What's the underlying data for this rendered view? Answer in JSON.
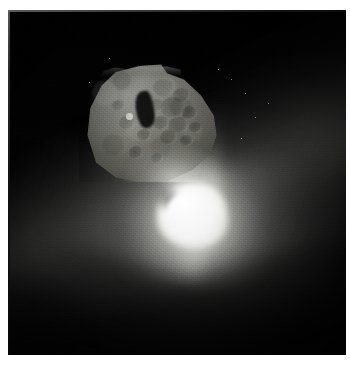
{
  "page": {
    "width": 350,
    "height": 366,
    "background_color": "#ffffff",
    "kind": "photograph"
  },
  "frame": {
    "name": "white-photo-border",
    "border_color": "#ffffff",
    "inset_left": 8,
    "inset_top": 10,
    "image_width": 338,
    "image_height": 345,
    "field_color": "#000000"
  },
  "photo": {
    "subject": "comet nucleus with impact flash and ejecta plume",
    "alt_text": "Irregular potato-shaped comet nucleus lit from below by a brilliant white impact flash, with dust ejecta fanning outward against black space",
    "palette": {
      "space_black": "#000000",
      "nucleus_mid_grey": "#87877f",
      "nucleus_highlight": "#b4b4ae",
      "nucleus_shadow": "#575750",
      "flash_white": "#ffffff",
      "coma_grey": "#6e6e6c",
      "notch_black": "#0b0b0a"
    },
    "features": [
      {
        "name": "nucleus",
        "label": "comet nucleus",
        "description": "irregular rounded body occupying the upper-left-of-centre of the frame",
        "center_pct": {
          "x": 42,
          "y": 32
        },
        "size_pct": {
          "w": 42,
          "h": 36
        }
      },
      {
        "name": "impact-flash",
        "label": "impact flash",
        "description": "saturated white burst at the base of the nucleus",
        "center_pct": {
          "x": 54,
          "y": 59
        },
        "size_pct": {
          "w": 21,
          "h": 19
        }
      },
      {
        "name": "ejecta-plume",
        "label": "ejecta plume",
        "description": "bright dust fan spreading left, right and downward from the flash"
      },
      {
        "name": "dust-band",
        "label": "diffuse dust band",
        "description": "broad diagonal glow running from lower-left to upper-right"
      },
      {
        "name": "crater-field",
        "label": "crater field",
        "description": "cluster of shallow circular depressions on the sunlit right half of the nucleus"
      },
      {
        "name": "shadow-notch",
        "label": "shadowed notch",
        "description": "dark angular hollow near the top centre of the nucleus"
      }
    ],
    "craters": [
      {
        "x": 60,
        "y": 24,
        "r": 7.5
      },
      {
        "x": 72,
        "y": 30,
        "r": 6.0
      },
      {
        "x": 66,
        "y": 40,
        "r": 8.5
      },
      {
        "x": 78,
        "y": 44,
        "r": 5.5
      },
      {
        "x": 55,
        "y": 38,
        "r": 5.0
      },
      {
        "x": 70,
        "y": 54,
        "r": 7.0
      },
      {
        "x": 58,
        "y": 52,
        "r": 5.5
      },
      {
        "x": 82,
        "y": 56,
        "r": 4.5
      },
      {
        "x": 50,
        "y": 48,
        "r": 4.0
      },
      {
        "x": 63,
        "y": 64,
        "r": 6.0
      },
      {
        "x": 76,
        "y": 66,
        "r": 4.5
      },
      {
        "x": 46,
        "y": 62,
        "r": 5.0
      },
      {
        "x": 34,
        "y": 52,
        "r": 5.5
      },
      {
        "x": 28,
        "y": 38,
        "r": 4.5
      },
      {
        "x": 40,
        "y": 76,
        "r": 5.0
      },
      {
        "x": 55,
        "y": 80,
        "r": 4.0
      }
    ],
    "specks": [
      {
        "x": 66,
        "y": 20
      },
      {
        "x": 70,
        "y": 24
      },
      {
        "x": 73,
        "y": 31
      },
      {
        "x": 62,
        "y": 17
      },
      {
        "x": 77,
        "y": 27
      },
      {
        "x": 30,
        "y": 14
      },
      {
        "x": 24,
        "y": 21
      },
      {
        "x": 69,
        "y": 37
      }
    ]
  }
}
